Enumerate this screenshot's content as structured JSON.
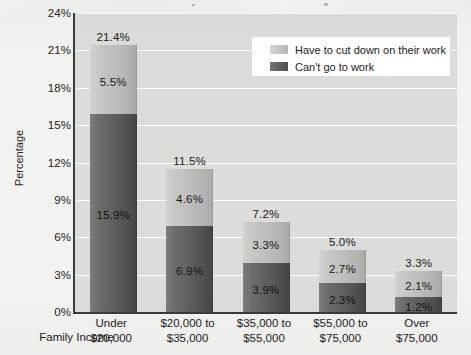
{
  "chart_data": {
    "type": "bar",
    "subtype": "stacked-bar",
    "title": "",
    "xlabel": "Family Income",
    "ylabel": "Percentage",
    "ylim": [
      0,
      24
    ],
    "ytick_labels": [
      "0%",
      "3%",
      "6%",
      "9%",
      "12%",
      "15%",
      "18%",
      "21%",
      "24%"
    ],
    "ytick_values": [
      0,
      3,
      6,
      9,
      12,
      15,
      18,
      21,
      24
    ],
    "grid": true,
    "legend_position": "top-right",
    "categories": [
      "Under $20,000",
      "$20,000 to $35,000",
      "$35,000 to $55,000",
      "$55,000 to $75,000",
      "Over $75,000"
    ],
    "category_lines": [
      [
        "Under",
        "$20,000"
      ],
      [
        "$20,000 to",
        "$35,000"
      ],
      [
        "$35,000 to",
        "$55,000"
      ],
      [
        "$55,000 to",
        "$75,000"
      ],
      [
        "Over",
        "$75,000"
      ]
    ],
    "series": [
      {
        "name": "Can't go to work",
        "color": "#5a5a58",
        "values": [
          15.9,
          6.9,
          3.9,
          2.3,
          1.2
        ],
        "labels": [
          "15.9%",
          "6.9%",
          "3.9%",
          "2.3%",
          "1.2%"
        ]
      },
      {
        "name": "Have to cut down on their work",
        "color": "#c0c0be",
        "values": [
          5.5,
          4.6,
          3.3,
          2.7,
          2.1
        ],
        "labels": [
          "5.5%",
          "4.6%",
          "3.3%",
          "2.7%",
          "2.1%"
        ]
      }
    ],
    "totals": [
      21.4,
      11.5,
      7.2,
      5.0,
      3.3
    ],
    "total_labels": [
      "21.4%",
      "11.5%",
      "7.2%",
      "5.0%",
      "3.3%"
    ]
  },
  "legend": {
    "items": [
      {
        "label": "Have to cut down on their work",
        "swatch": "light"
      },
      {
        "label": "Can't go to work",
        "swatch": "dark"
      }
    ]
  },
  "axes": {
    "y_title": "Percentage",
    "x_title": "Family Income"
  },
  "colors": {
    "plot_background": "#dcdcda",
    "page_background": "#f2f2f1",
    "gridline": "#fbfbfa",
    "axis": "#3a3a38",
    "series_dark": "#5a5a58",
    "series_light": "#c0c0be",
    "legend_background": "#ffffff"
  }
}
